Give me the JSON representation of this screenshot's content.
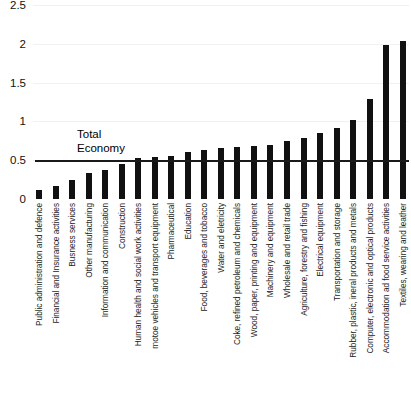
{
  "chart_data": {
    "type": "bar",
    "title": "",
    "xlabel": "",
    "ylabel": "",
    "ylim": [
      0,
      2.5
    ],
    "yticks": [
      "0",
      "0.5",
      "1",
      "1.5",
      "2",
      "2.5"
    ],
    "grid": true,
    "legend": null,
    "bar_color": "#111111",
    "annotations": [
      {
        "text": "Total\nEconomy",
        "value": 0.5,
        "type": "reference-line",
        "label": "Total Economy"
      }
    ],
    "categories": [
      "Public administration and defence",
      "Financial and Insurance activities",
      "Busness services",
      "Other manufacturing",
      "Information and communication",
      "Construction",
      "Human health and social work activities",
      "motoe vehicles and transport equipment",
      "Pharmaceutical",
      "Education",
      "Food, beverages and tobacco",
      "Water and eletricity",
      "Coke, refined petroleum and chemicals",
      "Wood, paper, printing and equipment",
      "Machinery and equipment",
      "Wholesale and retail trade",
      "Agriculture, forestry and fishing",
      "Electrical equipment",
      "Transportation and storage",
      "Rubber, plastic, ineral products and metals",
      "Computer, electronic and optical products",
      "Accommodation ad food service activities",
      "Textiles, wearing and leather"
    ],
    "values": [
      0.11,
      0.17,
      0.24,
      0.33,
      0.38,
      0.45,
      0.53,
      0.54,
      0.55,
      0.6,
      0.63,
      0.66,
      0.67,
      0.68,
      0.7,
      0.75,
      0.79,
      0.85,
      0.92,
      1.02,
      1.29,
      1.98,
      2.03
    ]
  }
}
